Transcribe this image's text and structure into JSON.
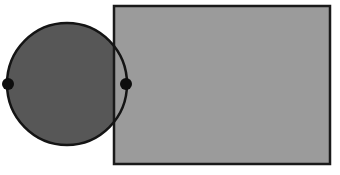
{
  "figure": {
    "canvas": {
      "width": 340,
      "height": 175,
      "background_color": "#ffffff"
    },
    "shapes": [
      {
        "id": "rectangle",
        "kind": "rectangle",
        "label": "Rectangle",
        "x": 114,
        "y": 6,
        "width": 216,
        "height": 158,
        "fill_color": "#9b9b9b",
        "stroke_color": "#1a1a1a",
        "stroke_width": 2.5
      },
      {
        "id": "circle",
        "kind": "circle",
        "label": "Circle",
        "center_x": 67,
        "center_y": 84,
        "radius_x": 60,
        "radius_y": 61,
        "fill_color": "#575757",
        "stroke_color": "#141414",
        "stroke_width": 2.5
      }
    ],
    "points": [
      {
        "id": "left-endpoint",
        "label": "Left diameter endpoint",
        "x": 8,
        "y": 84,
        "radius": 6,
        "color": "#0d0d0d"
      },
      {
        "id": "right-endpoint",
        "label": "Right diameter endpoint",
        "x": 126,
        "y": 84,
        "radius": 6,
        "color": "#0d0d0d"
      }
    ],
    "z_order_note": "circle fill below rectangle fill; circle outline and endpoint dots on top",
    "colors": {
      "circle_fill": "#575757",
      "rectangle_fill": "#9b9b9b",
      "outline": "#141414",
      "point": "#0d0d0d",
      "background": "#ffffff"
    }
  }
}
